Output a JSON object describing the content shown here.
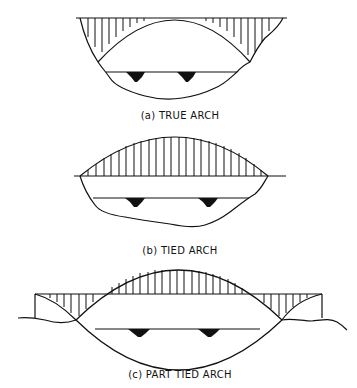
{
  "figure": {
    "panels": [
      {
        "id": "a",
        "caption": "(a) TRUE ARCH"
      },
      {
        "id": "b",
        "caption": "(b) TIED ARCH"
      },
      {
        "id": "c",
        "caption": "(c) PART TIED ARCH"
      }
    ],
    "colors": {
      "ink": "#111111",
      "background": "#ffffff"
    }
  }
}
